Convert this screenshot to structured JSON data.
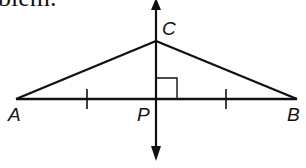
{
  "header": {
    "cut_text": "blem."
  },
  "diagram": {
    "stroke_color": "#111111",
    "background": "#ffffff",
    "points": {
      "A": {
        "label": "A",
        "x": 16,
        "y": 99
      },
      "B": {
        "label": "B",
        "x": 297,
        "y": 99
      },
      "C": {
        "label": "C",
        "x": 156,
        "y": 41
      },
      "P": {
        "label": "P",
        "x": 156,
        "y": 99
      }
    },
    "segments": [
      "AB",
      "AC",
      "BC"
    ],
    "perpendicular_line": {
      "through": [
        "C",
        "P"
      ],
      "arrows": "both ends"
    },
    "congruence_ticks": [
      "AP",
      "PB"
    ],
    "right_angle_at": "P"
  }
}
